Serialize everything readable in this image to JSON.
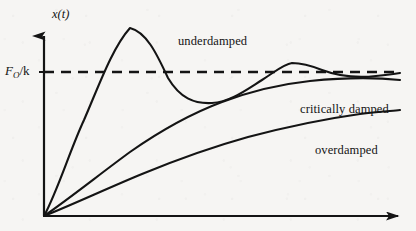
{
  "figure": {
    "background_color": "#f6f5f3",
    "ink_color": "#141414",
    "width": 416,
    "height": 231
  },
  "axes": {
    "y_axis_label": "x(t)",
    "x_axis_label": "",
    "origin": {
      "x": 44,
      "y": 216
    },
    "y_axis_tip": {
      "x": 44,
      "y": 30
    },
    "x_axis_tip": {
      "x": 410,
      "y": 216
    },
    "arrowheads": true,
    "tick_marks": [
      {
        "name": "threshold-tick",
        "x": 44,
        "y": 72
      }
    ]
  },
  "threshold": {
    "label_symbol": "F",
    "label_subscript": "O",
    "label_suffix": "/k",
    "label_full": "F_O /k",
    "y": 72,
    "x_start": 44,
    "x_end": 400,
    "dash": "10 7",
    "style": "dashed"
  },
  "labels": {
    "underdamped": "underdamped",
    "critically_damped": "critically damped",
    "overdamped": "overdamped"
  },
  "chart_data": {
    "type": "line",
    "title": "",
    "xlabel": "",
    "ylabel": "x(t)",
    "grid": false,
    "legend_position": "inline-annotations",
    "axis_pixel_ranges": {
      "x": [
        44,
        410
      ],
      "y": [
        216,
        30
      ]
    },
    "annotations": [
      {
        "text": "underdamped",
        "x": 178,
        "y": 35
      },
      {
        "text": "critically damped",
        "x": 300,
        "y": 103
      },
      {
        "text": "overdamped",
        "x": 315,
        "y": 144
      },
      {
        "text": "F_O /k",
        "x": 5,
        "y": 64
      },
      {
        "text": "x(t)",
        "x": 52,
        "y": 8
      }
    ],
    "reference_lines": [
      {
        "name": "steady-state",
        "orientation": "horizontal",
        "value_label": "F_O /k",
        "y_pixel": 72,
        "style": "dashed"
      }
    ],
    "series": [
      {
        "name": "underdamped",
        "description": "Oscillatory overshoot decaying to the steady-state value F_O/k",
        "path": "M 44 216 C 58 190 70 150 84 120 C 98 88 112 48 130 28 C 146 32 156 52 168 78 C 180 98 194 104 212 103 C 230 102 246 90 262 80 C 276 71 284 64 292 63 C 302 63 312 66 322 70 C 338 76 358 78 376 76 C 386 75 394 74 400 73"
      },
      {
        "name": "critically damped",
        "description": "Fastest non-oscillatory approach to the steady-state value",
        "path": "M 44 216 C 70 198 100 174 130 152 C 160 131 190 114 222 102 C 254 90 282 84 310 81 C 340 78 372 77 400 80"
      },
      {
        "name": "overdamped",
        "description": "Slow non-oscillatory approach to the steady-state value",
        "path": "M 44 216 C 74 204 108 188 142 174 C 176 160 212 147 248 137 C 286 127 324 119 360 114 C 376 112 390 111 400 110"
      }
    ]
  }
}
